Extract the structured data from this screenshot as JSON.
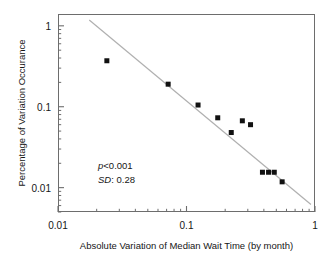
{
  "chart_data": {
    "type": "scatter",
    "title": "",
    "xlabel": "Absolute Variation of Median Wait Time (by month)",
    "ylabel": "Percentage of Variation Occurance",
    "xscale": "log",
    "yscale": "log",
    "xlim": [
      0.01,
      1
    ],
    "ylim": [
      0.005,
      1.4
    ],
    "grid": false,
    "legend": null,
    "xticks": [
      {
        "value": 0.01,
        "label": "0.01"
      },
      {
        "value": 0.1,
        "label": "0.1"
      },
      {
        "value": 1,
        "label": "1"
      }
    ],
    "yticks": [
      {
        "value": 1,
        "label": "1"
      },
      {
        "value": 0.1,
        "label": "0.1"
      },
      {
        "value": 0.01,
        "label": "0.01"
      }
    ],
    "points": [
      {
        "x": 0.024,
        "y": 0.37
      },
      {
        "x": 0.072,
        "y": 0.19
      },
      {
        "x": 0.123,
        "y": 0.105
      },
      {
        "x": 0.175,
        "y": 0.073
      },
      {
        "x": 0.223,
        "y": 0.048
      },
      {
        "x": 0.272,
        "y": 0.067
      },
      {
        "x": 0.315,
        "y": 0.06
      },
      {
        "x": 0.39,
        "y": 0.0155
      },
      {
        "x": 0.435,
        "y": 0.0155
      },
      {
        "x": 0.482,
        "y": 0.0155
      },
      {
        "x": 0.555,
        "y": 0.0118
      }
    ],
    "marker": {
      "shape": "square",
      "color": "#111111",
      "size": 5
    },
    "fit_line": {
      "label": "regression-line",
      "color": "#b0b0b0",
      "x_start": 0.0175,
      "y_start": 1.18,
      "x_end": 0.93,
      "y_end": 0.0062
    },
    "annotations": [
      {
        "name": "p-value",
        "italic_prefix": "p",
        "rest": "<0.001"
      },
      {
        "name": "sd-value",
        "italic_prefix": "SD",
        "rest": ": 0.28"
      }
    ]
  },
  "axes": {
    "x_title": "Absolute Variation of Median Wait Time (by month)",
    "y_title": "Percentage of Variation Occurance",
    "x_tick_labels": [
      "0.01",
      "0.1",
      "1"
    ],
    "y_tick_labels": [
      "1",
      "0.1",
      "0.01"
    ]
  },
  "stats": {
    "p_symbol": "p",
    "p_text": "<0.001",
    "sd_symbol": "SD",
    "sd_text": ": 0.28"
  },
  "colors": {
    "marker": "#111111",
    "fit_line": "#b0b0b0",
    "axis": "#6d6d6d",
    "text": "#161616",
    "background": "#ffffff"
  }
}
